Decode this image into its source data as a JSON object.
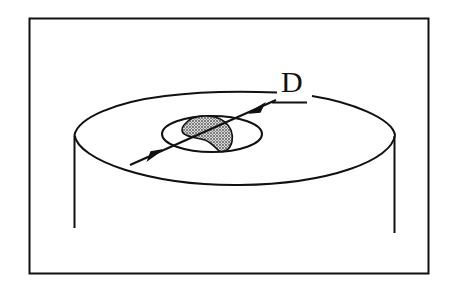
{
  "diagram": {
    "labels": {
      "dimension_label": "D"
    },
    "colors": {
      "stroke": "#111111",
      "background": "#ffffff",
      "shaded_fill": "#8a8a8a"
    }
  }
}
